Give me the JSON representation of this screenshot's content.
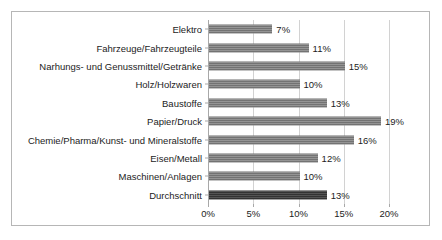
{
  "chart_data": {
    "type": "bar",
    "orientation": "horizontal",
    "title": "",
    "xlabel": "",
    "ylabel": "",
    "xlim": [
      0,
      20
    ],
    "grid": true,
    "legend": false,
    "value_suffix": "%",
    "tick_labels": [
      "0%",
      "5%",
      "10%",
      "15%",
      "20%"
    ],
    "ticks": [
      0,
      5,
      10,
      15,
      20
    ],
    "categories": [
      "Elektro",
      "Fahrzeuge/Fahrzeugteile",
      "Narhungs- und Genussmittel/Getränke",
      "Holz/Holzwaren",
      "Baustoffe",
      "Papier/Druck",
      "Chemie/Pharma/Kunst- und Mineralstoffe",
      "Eisen/Metall",
      "Maschinen/Anlagen",
      "Durchschnitt"
    ],
    "values": [
      7,
      11,
      15,
      10,
      13,
      19,
      16,
      12,
      10,
      13
    ],
    "value_labels": [
      "7%",
      "11%",
      "15%",
      "10%",
      "13%",
      "19%",
      "16%",
      "12%",
      "10%",
      "13%"
    ],
    "highlight_index": 9,
    "colors": {
      "bar": "#808080",
      "bar_highlight": "#3b3b3b",
      "gridline": "#d2d2d2",
      "axis": "#a8a8a8",
      "frame": "#b6b6b6",
      "text": "#1c1c1c",
      "background": "#ffffff"
    }
  }
}
